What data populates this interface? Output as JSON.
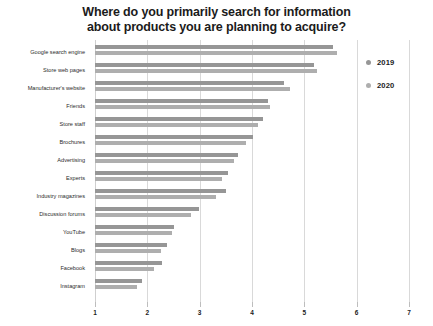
{
  "chart_data": {
    "type": "bar",
    "orientation": "horizontal",
    "title": "Where do you primarily search for information about products you are planning to acquire?",
    "title_lines": [
      "Where do you primarily search for information",
      "about products you are planning to acquire?"
    ],
    "xlabel": "",
    "ylabel": "",
    "xlim": [
      1,
      7
    ],
    "xticks": [
      1,
      2,
      3,
      4,
      5,
      6,
      7
    ],
    "xtick_labels": [
      "1",
      "2",
      "3",
      "4",
      "5",
      "6",
      "7"
    ],
    "grid": true,
    "grid_axis": "x",
    "legend_position": "right",
    "categories": [
      "Google search engine",
      "Store web pages",
      "Manufacturer's website",
      "Friends",
      "Store staff",
      "Brochures",
      "Advertising",
      "Experts",
      "Industry magazines",
      "Discussion forums",
      "YouTube",
      "Blogs",
      "Facebook",
      "Instagram"
    ],
    "series": [
      {
        "name": "2019",
        "color": "#969696",
        "values": [
          5.55,
          5.19,
          4.62,
          4.3,
          4.21,
          4.02,
          3.74,
          3.55,
          3.51,
          2.98,
          2.51,
          2.38,
          2.28,
          1.89
        ]
      },
      {
        "name": "2020",
        "color": "#aeaeae",
        "values": [
          5.62,
          5.25,
          4.72,
          4.34,
          4.11,
          3.89,
          3.66,
          3.42,
          3.32,
          2.83,
          2.47,
          2.26,
          2.13,
          1.81
        ]
      }
    ]
  },
  "legend": {
    "items": [
      {
        "label": "2019",
        "color": "#969696"
      },
      {
        "label": "2020",
        "color": "#aeaeae"
      }
    ]
  }
}
